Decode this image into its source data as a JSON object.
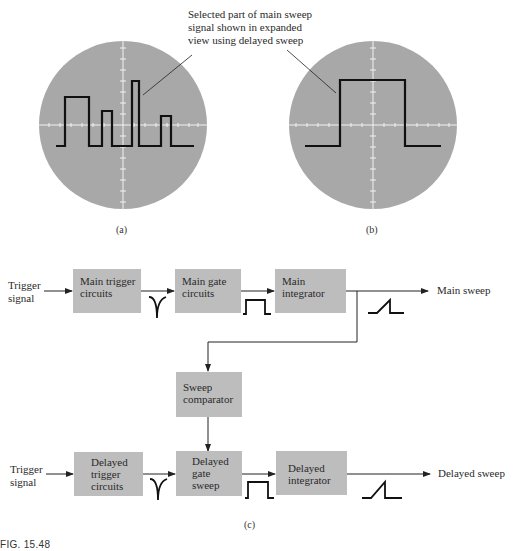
{
  "figure": {
    "number": "FIG. 15.48",
    "sublabels": {
      "a": "(a)",
      "b": "(b)",
      "c": "(c)"
    },
    "annotation": {
      "line1": "Selected part of main sweep",
      "line2": "signal shown in expanded",
      "line3": "view using delayed sweep"
    }
  },
  "scopes": {
    "a": {
      "description": "Main sweep display: series of pulses of varying widths/heights"
    },
    "b": {
      "description": "Expanded view of selected pulse using delayed sweep"
    }
  },
  "diagram": {
    "main_row": {
      "input_label": {
        "line1": "Trigger",
        "line2": "signal"
      },
      "blocks": [
        {
          "line1": "Main trigger",
          "line2": "circuits"
        },
        {
          "line1": "Main gate",
          "line2": "circuits"
        },
        {
          "line1": "Main",
          "line2": "integrator"
        }
      ],
      "output_label": "Main sweep"
    },
    "comparator": {
      "line1": "Sweep",
      "line2": "comparator"
    },
    "delayed_row": {
      "input_label": {
        "line1": "Trigger",
        "line2": "signal"
      },
      "blocks": [
        {
          "line1": "Delayed",
          "line2": "trigger",
          "line3": "circuits"
        },
        {
          "line1": "Delayed",
          "line2": "gate",
          "line3": "sweep"
        },
        {
          "line1": "Delayed",
          "line2": "integrator"
        }
      ],
      "output_label": "Delayed sweep"
    }
  },
  "colors": {
    "screen": "#a8a8a8",
    "block": "#bdbdbd",
    "trace": "#111111",
    "graticule": "#f2f2f2"
  }
}
